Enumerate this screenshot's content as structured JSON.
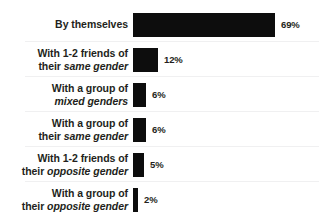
{
  "chart_data": {
    "type": "bar",
    "orientation": "horizontal",
    "title": "",
    "subtitle": "",
    "xlabel": "",
    "ylabel": "",
    "xlim": [
      0,
      69
    ],
    "grid": false,
    "legend": null,
    "value_suffix": "%",
    "categories": [
      "By themselves",
      "With 1-2 friends of their same gender",
      "With a group of mixed genders",
      "With a group of their same gender",
      "With 1-2 friends of their opposite gender",
      "With a group of their opposite gender"
    ],
    "values": [
      69,
      12,
      6,
      6,
      5,
      2
    ],
    "value_labels": [
      "69%",
      "12%",
      "6%",
      "6%",
      "5%",
      "2%"
    ],
    "bar_color": "#0d0d0d",
    "text_color": "#231f20",
    "rule_color": "#f0f0f1",
    "background": "#ffffff"
  },
  "rows": [
    {
      "lines": [
        {
          "plain": "By themselves",
          "italic": ""
        }
      ],
      "value": "69%",
      "bar_px": 142
    },
    {
      "lines": [
        {
          "plain": "With 1-2 friends of",
          "italic": ""
        },
        {
          "plain": "their ",
          "italic": "same gender"
        }
      ],
      "value": "12%",
      "bar_px": 25
    },
    {
      "lines": [
        {
          "plain": "With a group of",
          "italic": ""
        },
        {
          "plain": "",
          "italic": "mixed genders"
        }
      ],
      "value": "6%",
      "bar_px": 13
    },
    {
      "lines": [
        {
          "plain": "With a group of",
          "italic": ""
        },
        {
          "plain": "their ",
          "italic": "same gender"
        }
      ],
      "value": "6%",
      "bar_px": 13
    },
    {
      "lines": [
        {
          "plain": "With 1-2 friends of",
          "italic": ""
        },
        {
          "plain": "their ",
          "italic": "opposite gender"
        }
      ],
      "value": "5%",
      "bar_px": 11
    },
    {
      "lines": [
        {
          "plain": "With a group of",
          "italic": ""
        },
        {
          "plain": "their ",
          "italic": "opposite gender"
        }
      ],
      "value": "2%",
      "bar_px": 5
    }
  ]
}
